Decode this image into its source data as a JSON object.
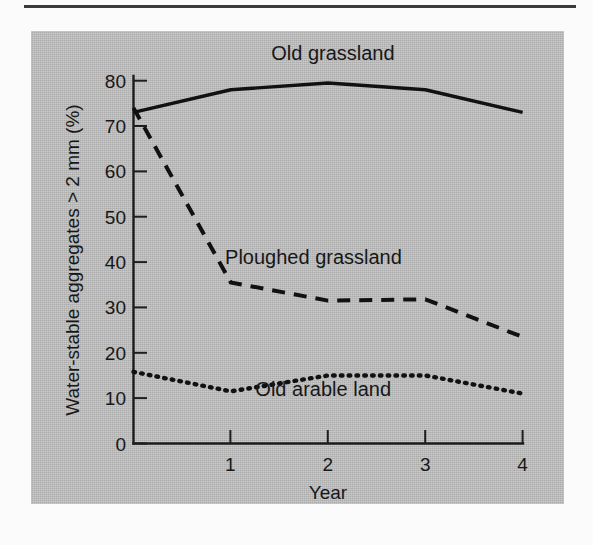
{
  "figure": {
    "panel_color": "#b9b9b9",
    "ink_color": "#111111"
  },
  "chart_data": {
    "type": "line",
    "title": "",
    "subtitle": "",
    "xlabel": "Year",
    "ylabel": "Water-stable aggregates > 2 mm (%)",
    "x": [
      0,
      1,
      2,
      3,
      4
    ],
    "xlim": [
      0,
      4
    ],
    "ylim": [
      0,
      84
    ],
    "xticks": [
      1,
      2,
      3,
      4
    ],
    "xticklabels": [
      "1",
      "2",
      "3",
      "4"
    ],
    "yticks": [
      0,
      10,
      20,
      30,
      40,
      50,
      60,
      70,
      80
    ],
    "yticklabels": [
      "0",
      "10",
      "20",
      "30",
      "40",
      "50",
      "60",
      "70",
      "80"
    ],
    "grid": false,
    "legend_position": "inline-labels",
    "series": [
      {
        "name": "Old grassland",
        "style": "solid",
        "values": [
          73,
          78,
          79.5,
          78,
          73
        ],
        "label_x": 2.05,
        "label_y": 84.5
      },
      {
        "name": "Ploughed grassland",
        "style": "dashed",
        "values": [
          74,
          35.5,
          31.5,
          31.8,
          23.5
        ],
        "label_x": 1.85,
        "label_y": 39.5
      },
      {
        "name": "Old arable land",
        "style": "dotted",
        "values": [
          15.8,
          11.5,
          15.0,
          15.0,
          11.0
        ],
        "label_x": 1.95,
        "label_y": 10.5
      }
    ],
    "annotations": [
      {
        "text": "Old grassland",
        "series": "Old grassland"
      },
      {
        "text": "Ploughed grassland",
        "series": "Ploughed grassland"
      },
      {
        "text": "Old arable land",
        "series": "Old arable land"
      }
    ]
  }
}
